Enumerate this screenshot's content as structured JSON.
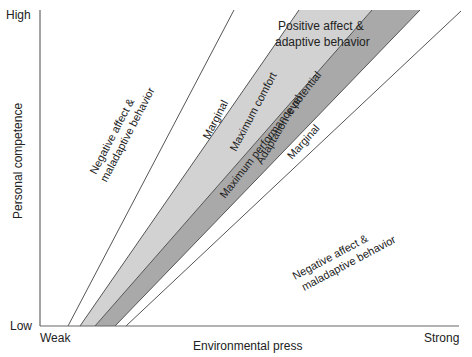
{
  "diagram": {
    "title": "",
    "axes": {
      "y_label": "Personal competence",
      "y_high": "High",
      "y_low": "Low",
      "x_label": "Environmental press",
      "x_weak": "Weak",
      "x_strong": "Strong"
    },
    "regions": {
      "negative_upper_line1": "Negative affect &",
      "negative_upper_line2": "maladaptive behavior",
      "marginal_upper": "Marginal",
      "max_comfort": "Maximum comfort",
      "adaptation_level": "Adaptation level",
      "max_performance": "Maximum performance potential",
      "marginal_lower": "Marginal",
      "positive_line1": "Positive affect &",
      "positive_line2": "adaptive behavior",
      "negative_lower_line1": "Negative affect &",
      "negative_lower_line2": "maladaptive behavior"
    },
    "colors": {
      "light_band": "#d2d2d2",
      "dark_band": "#a9a9a9",
      "lines": "#555555",
      "axis": "#666666"
    }
  }
}
